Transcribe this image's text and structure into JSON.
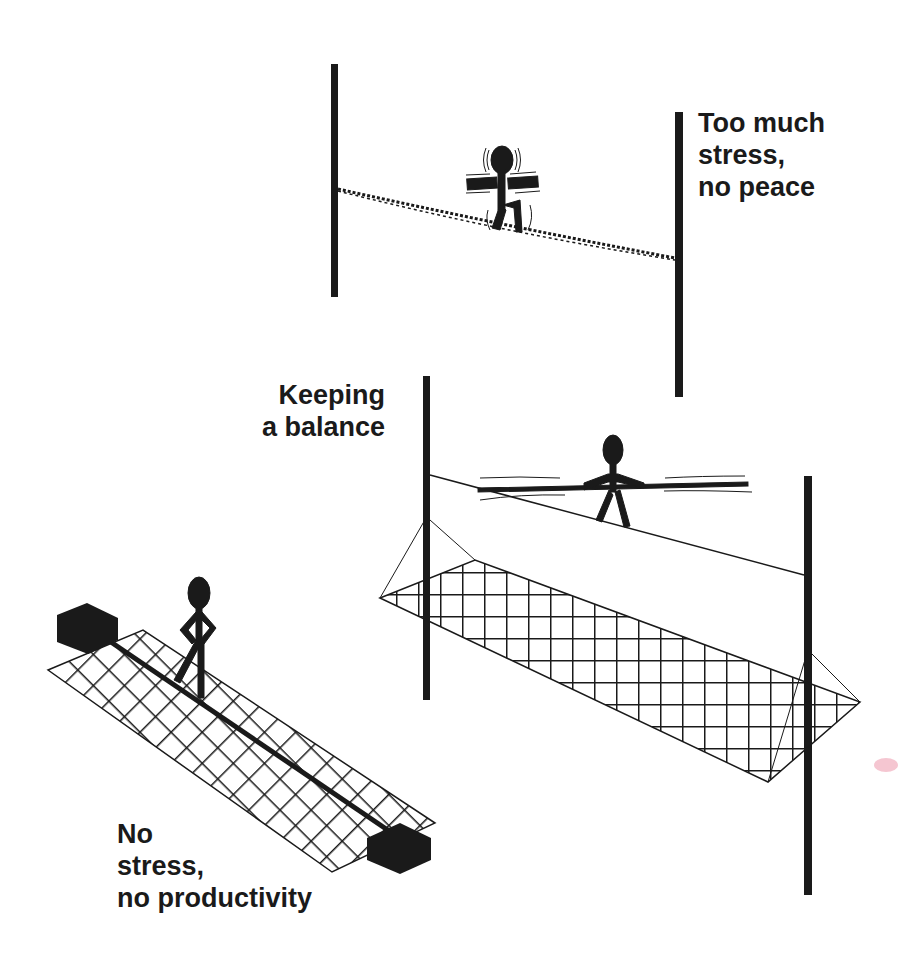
{
  "illustration": {
    "title": "Stress balance tightrope metaphor",
    "colors": {
      "ink": "#1a1a1a",
      "background": "#ffffff"
    },
    "scenes": [
      {
        "id": "too-much",
        "label_lines": [
          "Too much",
          "stress,",
          "no peace"
        ],
        "description": "Shaking stick figure on sagging dotted rope between two poles, no net"
      },
      {
        "id": "balance",
        "label_lines": [
          "Keeping",
          "a balance"
        ],
        "description": "Stick figure with balance pole on taut rope between two poles with safety net below"
      },
      {
        "id": "no-stress",
        "label_lines": [
          "No",
          "stress,",
          "no productivity"
        ],
        "description": "Stick figure standing on rope lying on net on the ground, anchored by two blocks"
      }
    ]
  },
  "labels": {
    "top": "Too much\nstress,\nno peace",
    "mid": "Keeping\na balance",
    "bot": "No\nstress,\nno productivity"
  }
}
